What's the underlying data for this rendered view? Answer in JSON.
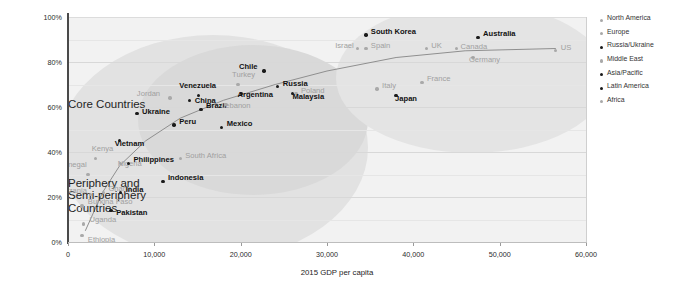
{
  "chart_data": {
    "type": "scatter",
    "title": "",
    "xlabel": "2015 GDP per capita",
    "ylabel": "Adults who use the internet occasionally or own a smartphone",
    "xlim": [
      0,
      60000
    ],
    "ylim": [
      0,
      100
    ],
    "xticks": [
      "0",
      "10,000",
      "20,000",
      "30,000",
      "40,000",
      "50,000",
      "60,000"
    ],
    "yticks": [
      "0%",
      "20%",
      "40%",
      "60%",
      "80%",
      "100%"
    ],
    "grid": true,
    "legend_position": "right",
    "annotations": [
      {
        "text": "Periphery and\nSemi-periphery\nCountries",
        "x": 19500,
        "y": 29
      },
      {
        "text": "Core Countries",
        "x": 41500,
        "y": 64
      }
    ],
    "series": [
      {
        "name": "North America",
        "color": "#a9a9a9",
        "style": "light"
      },
      {
        "name": "Europe",
        "color": "#a9a9a9",
        "style": "light"
      },
      {
        "name": "Russia/Ukraine",
        "color": "#1a1a1a",
        "style": "dark"
      },
      {
        "name": "Middle East",
        "color": "#a9a9a9",
        "style": "light"
      },
      {
        "name": "Asia/Pacific",
        "color": "#1a1a1a",
        "style": "dark"
      },
      {
        "name": "Latin America",
        "color": "#1a1a1a",
        "style": "dark"
      },
      {
        "name": "Africa",
        "color": "#a9a9a9",
        "style": "light"
      }
    ],
    "points": [
      {
        "label": "Ethiopia",
        "gdp": 1600,
        "pct": 3,
        "group": "Africa",
        "style": "light",
        "lx": 6,
        "ly": 5
      },
      {
        "label": "Uganda",
        "gdp": 1800,
        "pct": 8,
        "group": "Africa",
        "style": "light",
        "lx": 6,
        "ly": -4
      },
      {
        "label": "Burkina Faso",
        "gdp": 1600,
        "pct": 16,
        "group": "Africa",
        "style": "light",
        "lx": 6,
        "ly": -4
      },
      {
        "label": "Pakistan",
        "gdp": 5000,
        "pct": 14,
        "group": "Asia/Pacific",
        "style": "dark",
        "lx": 5,
        "ly": 2
      },
      {
        "label": "Tanzania",
        "gdp": 2600,
        "pct": 21,
        "group": "Africa",
        "style": "light",
        "lx": -34,
        "ly": -4
      },
      {
        "label": "Ghana",
        "gdp": 4100,
        "pct": 22,
        "group": "Africa",
        "style": "light",
        "lx": 5,
        "ly": -4
      },
      {
        "label": "India",
        "gdp": 6100,
        "pct": 22,
        "group": "Asia/Pacific",
        "style": "dark",
        "lx": 5,
        "ly": -3
      },
      {
        "label": "Indonesia",
        "gdp": 11000,
        "pct": 27,
        "group": "Asia/Pacific",
        "style": "dark",
        "lx": 5,
        "ly": -3
      },
      {
        "label": "Senegal",
        "gdp": 2300,
        "pct": 30,
        "group": "Africa",
        "style": "light",
        "lx": -29,
        "ly": -10
      },
      {
        "label": "Nigeria",
        "gdp": 6100,
        "pct": 35,
        "group": "Africa",
        "style": "light",
        "lx": -3,
        "ly": 1
      },
      {
        "label": "Philippines",
        "gdp": 7000,
        "pct": 35,
        "group": "Asia/Pacific",
        "style": "dark",
        "lx": 5,
        "ly": -3
      },
      {
        "label": "Kenya",
        "gdp": 3200,
        "pct": 37,
        "group": "Africa",
        "style": "light",
        "lx": -4,
        "ly": -10
      },
      {
        "label": "South Africa",
        "gdp": 13000,
        "pct": 37,
        "group": "Africa",
        "style": "light",
        "lx": 5,
        "ly": -3
      },
      {
        "label": "Vietnam",
        "gdp": 6000,
        "pct": 45,
        "group": "Asia/Pacific",
        "style": "dark",
        "lx": -5,
        "ly": 3
      },
      {
        "label": "Peru",
        "gdp": 12300,
        "pct": 52,
        "group": "Latin America",
        "style": "dark",
        "lx": 5,
        "ly": -3
      },
      {
        "label": "Ukraine",
        "gdp": 8000,
        "pct": 57,
        "group": "Russia/Ukraine",
        "style": "dark",
        "lx": 5,
        "ly": -2
      },
      {
        "label": "Mexico",
        "gdp": 17800,
        "pct": 51,
        "group": "Latin America",
        "style": "dark",
        "lx": 5,
        "ly": -3
      },
      {
        "label": "Brazil",
        "gdp": 15400,
        "pct": 59,
        "group": "Latin America",
        "style": "dark",
        "lx": 5,
        "ly": -3
      },
      {
        "label": "Lebanon",
        "gdp": 18300,
        "pct": 61,
        "group": "Middle East",
        "style": "light",
        "lx": -5,
        "ly": 1
      },
      {
        "label": "Jordan",
        "gdp": 11800,
        "pct": 64,
        "group": "Middle East",
        "style": "light",
        "lx": -33,
        "ly": -4
      },
      {
        "label": "China",
        "gdp": 14100,
        "pct": 63,
        "group": "Asia/Pacific",
        "style": "dark",
        "lx": 5,
        "ly": 1
      },
      {
        "label": "Venezuela",
        "gdp": 15100,
        "pct": 65,
        "group": "Latin America",
        "style": "dark",
        "lx": -19,
        "ly": -10
      },
      {
        "label": "Argentina",
        "gdp": 20100,
        "pct": 66,
        "group": "Latin America",
        "style": "dark",
        "lx": -4,
        "ly": 1
      },
      {
        "label": "Turkey",
        "gdp": 19700,
        "pct": 70,
        "group": "Middle East",
        "style": "light",
        "lx": -6,
        "ly": -10
      },
      {
        "label": "Poland",
        "gdp": 26400,
        "pct": 66,
        "group": "Europe",
        "style": "light",
        "lx": 5,
        "ly": -3
      },
      {
        "label": "Malaysia",
        "gdp": 26000,
        "pct": 66,
        "group": "Asia/Pacific",
        "style": "dark",
        "lx": 0,
        "ly": 3
      },
      {
        "label": "Russia",
        "gdp": 24300,
        "pct": 69,
        "group": "Russia/Ukraine",
        "style": "dark",
        "lx": 5,
        "ly": -3
      },
      {
        "label": "Chile",
        "gdp": 22700,
        "pct": 76,
        "group": "Latin America",
        "style": "dark",
        "lx": -25,
        "ly": -4
      },
      {
        "label": "Israel",
        "gdp": 33500,
        "pct": 86,
        "group": "Middle East",
        "style": "light",
        "lx": -22,
        "ly": -3
      },
      {
        "label": "Italy",
        "gdp": 35800,
        "pct": 68,
        "group": "Europe",
        "style": "light",
        "lx": 5,
        "ly": -3
      },
      {
        "label": "Japan",
        "gdp": 38000,
        "pct": 65,
        "group": "Asia/Pacific",
        "style": "dark",
        "lx": -1,
        "ly": 3
      },
      {
        "label": "Spain",
        "gdp": 34500,
        "pct": 86,
        "group": "Europe",
        "style": "light",
        "lx": 5,
        "ly": -3
      },
      {
        "label": "South Korea",
        "gdp": 34500,
        "pct": 92,
        "group": "Asia/Pacific",
        "style": "dark",
        "lx": 5,
        "ly": -3
      },
      {
        "label": "France",
        "gdp": 41000,
        "pct": 71,
        "group": "Europe",
        "style": "light",
        "lx": 5,
        "ly": -3
      },
      {
        "label": "UK",
        "gdp": 41500,
        "pct": 86,
        "group": "Europe",
        "style": "light",
        "lx": 5,
        "ly": -3
      },
      {
        "label": "Canada",
        "gdp": 45000,
        "pct": 86,
        "group": "North America",
        "style": "light",
        "lx": 4,
        "ly": -2
      },
      {
        "label": "Germany",
        "gdp": 46900,
        "pct": 82,
        "group": "Europe",
        "style": "light",
        "lx": -4,
        "ly": 2
      },
      {
        "label": "Australia",
        "gdp": 47500,
        "pct": 91,
        "group": "Asia/Pacific",
        "style": "dark",
        "lx": 5,
        "ly": -3
      },
      {
        "label": "US",
        "gdp": 56500,
        "pct": 85,
        "group": "North America",
        "style": "light",
        "lx": 5,
        "ly": -3
      }
    ],
    "trend_curve": [
      {
        "gdp": 2000,
        "pct": 5
      },
      {
        "gdp": 4000,
        "pct": 22
      },
      {
        "gdp": 6000,
        "pct": 34
      },
      {
        "gdp": 9000,
        "pct": 45
      },
      {
        "gdp": 13000,
        "pct": 55
      },
      {
        "gdp": 18000,
        "pct": 63
      },
      {
        "gdp": 24000,
        "pct": 70
      },
      {
        "gdp": 30000,
        "pct": 76
      },
      {
        "gdp": 38000,
        "pct": 82
      },
      {
        "gdp": 46000,
        "pct": 85
      },
      {
        "gdp": 56500,
        "pct": 86
      }
    ]
  }
}
